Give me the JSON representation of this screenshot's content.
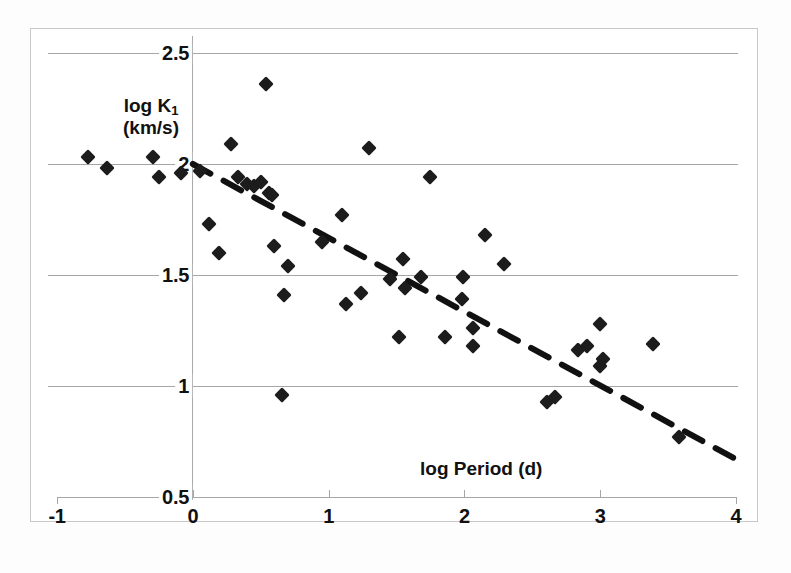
{
  "chart_data": {
    "type": "scatter",
    "title": "",
    "xlabel": "log Period (d)",
    "ylabel": "log K₁ (km/s)",
    "ylabel_line1": "log K",
    "ylabel_sub": "1",
    "ylabel_line2": "(km/s)",
    "xlim": [
      -1,
      4
    ],
    "ylim": [
      0.5,
      2.5
    ],
    "xticks": [
      -1,
      0,
      1,
      2,
      3,
      4
    ],
    "xtick_labels": [
      "-1",
      "0",
      "1",
      "2",
      "3",
      "4"
    ],
    "yticks": [
      0.5,
      1,
      1.5,
      2,
      2.5
    ],
    "ytick_labels": [
      "0.5",
      "1",
      "1.5",
      "2",
      "2.5"
    ],
    "grid": "horizontal",
    "legend": "none",
    "marker": "filled-diamond",
    "marker_color": "#1c1c1c",
    "trendline": {
      "style": "dashed",
      "color": "#111111",
      "x_start": 0.0,
      "y_start": 2.0,
      "x_end": 4.0,
      "y_end": 0.67,
      "slope": -0.333,
      "intercept": 2.0
    },
    "points": [
      [
        -0.77,
        2.03
      ],
      [
        -0.63,
        1.98
      ],
      [
        -0.29,
        2.03
      ],
      [
        -0.25,
        1.94
      ],
      [
        -0.09,
        1.96
      ],
      [
        0.05,
        1.97
      ],
      [
        0.12,
        1.73
      ],
      [
        0.19,
        1.6
      ],
      [
        0.28,
        2.09
      ],
      [
        0.33,
        1.94
      ],
      [
        0.4,
        1.91
      ],
      [
        0.45,
        1.9
      ],
      [
        0.5,
        1.92
      ],
      [
        0.54,
        2.36
      ],
      [
        0.56,
        1.87
      ],
      [
        0.58,
        1.86
      ],
      [
        0.6,
        1.63
      ],
      [
        0.66,
        0.96
      ],
      [
        0.67,
        1.41
      ],
      [
        0.7,
        1.54
      ],
      [
        0.95,
        1.65
      ],
      [
        1.1,
        1.77
      ],
      [
        1.13,
        1.37
      ],
      [
        1.24,
        1.42
      ],
      [
        1.3,
        2.07
      ],
      [
        1.45,
        1.48
      ],
      [
        1.52,
        1.22
      ],
      [
        1.55,
        1.57
      ],
      [
        1.56,
        1.44
      ],
      [
        1.68,
        1.49
      ],
      [
        1.75,
        1.94
      ],
      [
        1.86,
        1.22
      ],
      [
        1.98,
        1.39
      ],
      [
        1.99,
        1.49
      ],
      [
        2.06,
        1.26
      ],
      [
        2.06,
        1.18
      ],
      [
        2.15,
        1.68
      ],
      [
        2.29,
        1.55
      ],
      [
        2.61,
        0.93
      ],
      [
        2.67,
        0.95
      ],
      [
        2.84,
        1.16
      ],
      [
        2.9,
        1.18
      ],
      [
        3.0,
        1.28
      ],
      [
        3.0,
        1.09
      ],
      [
        3.02,
        1.12
      ],
      [
        3.39,
        1.19
      ],
      [
        3.58,
        0.77
      ]
    ]
  },
  "axes_geometry": {
    "x_pixel_at_min": 57,
    "x_pixel_at_max": 736,
    "y_pixel_at_min": 497,
    "y_pixel_at_max": 53
  }
}
